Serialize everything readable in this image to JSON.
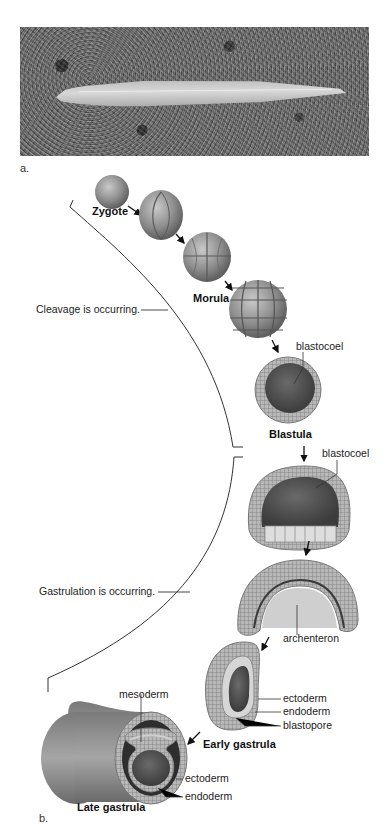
{
  "figure": {
    "panel_a": {
      "label": "a.",
      "photo_subject": "lancelet on gravel substrate (grayscale photograph)"
    },
    "panel_b": {
      "label": "b.",
      "stages": [
        {
          "name": "Zygote"
        },
        {
          "name": "Morula"
        },
        {
          "name": "Blastula"
        },
        {
          "name": "Early gastrula"
        },
        {
          "name": "Late gastrula"
        }
      ],
      "phases": [
        {
          "label": "Cleavage is occurring."
        },
        {
          "label": "Gastrulation is occurring."
        }
      ],
      "annotations": {
        "blastula_blastocoel": "blastocoel",
        "early_gastrulation_blastocoel": "blastocoel",
        "archenteron": "archenteron",
        "early_ectoderm": "ectoderm",
        "early_endoderm": "endoderm",
        "blastopore": "blastopore",
        "mesoderm": "mesoderm",
        "late_ectoderm": "ectoderm",
        "late_endoderm": "endoderm"
      }
    }
  }
}
